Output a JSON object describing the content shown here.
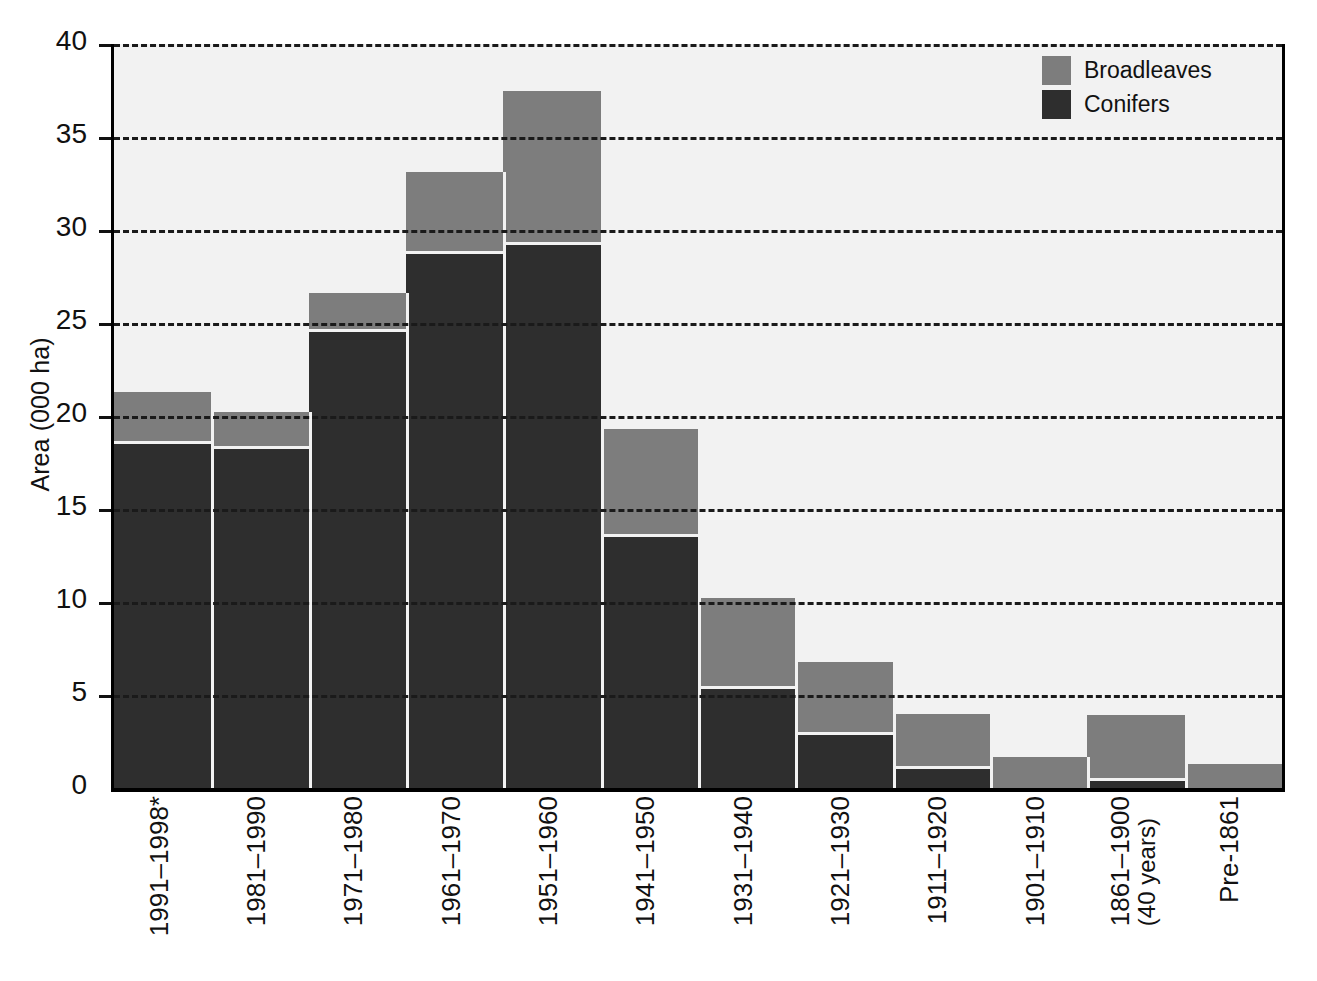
{
  "chart_data": {
    "type": "bar",
    "title": "",
    "subtitle": "",
    "xlabel": "",
    "ylabel": "Area (000 ha)",
    "stacked": true,
    "orientation": "vertical",
    "grid": true,
    "grid_style": "dashed-horizontal",
    "legend_position": "top-right",
    "ylim": [
      0,
      40
    ],
    "yticks": [
      0,
      5,
      10,
      15,
      20,
      25,
      30,
      35,
      40
    ],
    "ytick_labels": [
      "0",
      "5",
      "10",
      "15",
      "20",
      "25",
      "30",
      "35",
      "40"
    ],
    "categories": [
      "1991–1998*",
      "1981–1990",
      "1971–1980",
      "1961–1970",
      "1951–1960",
      "1941–1950",
      "1931–1940",
      "1921–1930",
      "1911–1920",
      "1901–1910",
      "1861–1900 (40 years)",
      "Pre-1861"
    ],
    "category_lines": [
      [
        "1991–1998*"
      ],
      [
        "1981–1990"
      ],
      [
        "1971–1980"
      ],
      [
        "1961–1970"
      ],
      [
        "1951–1960"
      ],
      [
        "1941–1950"
      ],
      [
        "1931–1940"
      ],
      [
        "1921–1930"
      ],
      [
        "1911–1920"
      ],
      [
        "1901–1910"
      ],
      [
        "1861–1900",
        "(40 years)"
      ],
      [
        "Pre-1861"
      ]
    ],
    "series": [
      {
        "name": "Conifers",
        "color": "#2e2e2e",
        "values": [
          18.5,
          18.2,
          24.5,
          28.7,
          29.2,
          13.5,
          5.3,
          2.85,
          1.0,
          0.0,
          0.4,
          0.0
        ]
      },
      {
        "name": "Broadleaves",
        "color": "#7d7d7d",
        "values": [
          2.8,
          2.0,
          2.1,
          4.4,
          8.3,
          5.8,
          4.9,
          3.95,
          3.0,
          1.65,
          3.55,
          1.3
        ]
      }
    ],
    "totals": [
      21.3,
      20.2,
      26.6,
      33.1,
      37.5,
      19.3,
      10.2,
      6.8,
      4.0,
      1.65,
      3.95,
      1.3
    ]
  },
  "legend": {
    "entries": [
      {
        "label": "Broadleaves",
        "color": "#7d7d7d"
      },
      {
        "label": "Conifers",
        "color": "#2e2e2e"
      }
    ]
  },
  "colors": {
    "broadleaves": "#7d7d7d",
    "conifers": "#2e2e2e",
    "plot_background": "#f2f2f2",
    "axis": "#111111",
    "page_background": "#ffffff"
  }
}
